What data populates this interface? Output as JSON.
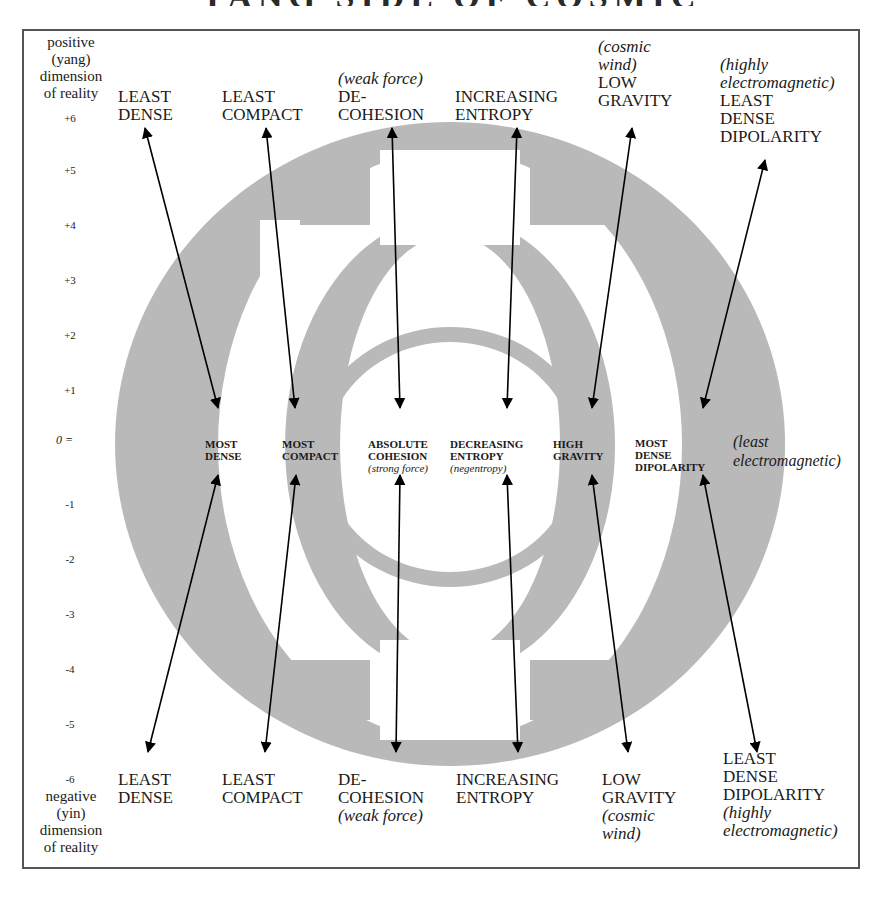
{
  "title_fragment": "YANG SIDE OF COSMIC",
  "colors": {
    "ring_gray": "#b9b9b9",
    "arrow": "#000000",
    "frame": "#555555"
  },
  "axis": {
    "top_label": [
      "positive",
      "(yang)",
      "dimension",
      "of reality"
    ],
    "bottom_label": [
      "negative",
      "(yin)",
      "dimension",
      "of reality"
    ],
    "ticks": [
      "+6",
      "+5",
      "+4",
      "+3",
      "+2",
      "+1",
      "0 =",
      "-1",
      "-2",
      "-3",
      "-4",
      "-5",
      "-6"
    ]
  },
  "top": [
    {
      "lines": [
        "LEAST",
        "DENSE"
      ]
    },
    {
      "lines": [
        "LEAST",
        "COMPACT"
      ]
    },
    {
      "note": "(weak force)",
      "lines": [
        "DE-",
        "COHESION"
      ]
    },
    {
      "lines": [
        "INCREASING",
        "ENTROPY"
      ]
    },
    {
      "note1": "(cosmic",
      "note2": "wind)",
      "lines": [
        "LOW",
        "GRAVITY"
      ]
    },
    {
      "note1": "(highly",
      "note2": "electromagnetic)",
      "lines": [
        "LEAST",
        "DENSE",
        "DIPOLARITY"
      ]
    }
  ],
  "middle": [
    {
      "lines": [
        "MOST",
        "DENSE"
      ]
    },
    {
      "lines": [
        "MOST",
        "COMPACT"
      ]
    },
    {
      "lines": [
        "ABSOLUTE",
        "COHESION"
      ],
      "note": "(strong force)"
    },
    {
      "lines": [
        "DECREASING",
        "ENTROPY"
      ],
      "note": "(negentropy)"
    },
    {
      "lines": [
        "HIGH",
        "GRAVITY"
      ]
    },
    {
      "lines": [
        "MOST",
        "DENSE",
        "DIPOLARITY"
      ]
    }
  ],
  "middle_side_note": [
    "(least",
    "electromagnetic)"
  ],
  "bottom": [
    {
      "lines": [
        "LEAST",
        "DENSE"
      ]
    },
    {
      "lines": [
        "LEAST",
        "COMPACT"
      ]
    },
    {
      "lines": [
        "DE-",
        "COHESION"
      ],
      "note": "(weak force)"
    },
    {
      "lines": [
        "INCREASING",
        "ENTROPY"
      ]
    },
    {
      "lines": [
        "LOW",
        "GRAVITY"
      ],
      "note1": "(cosmic",
      "note2": "wind)"
    },
    {
      "lines": [
        "LEAST",
        "DENSE",
        "DIPOLARITY"
      ],
      "note1": "(highly",
      "note2": "electromagnetic)"
    }
  ]
}
